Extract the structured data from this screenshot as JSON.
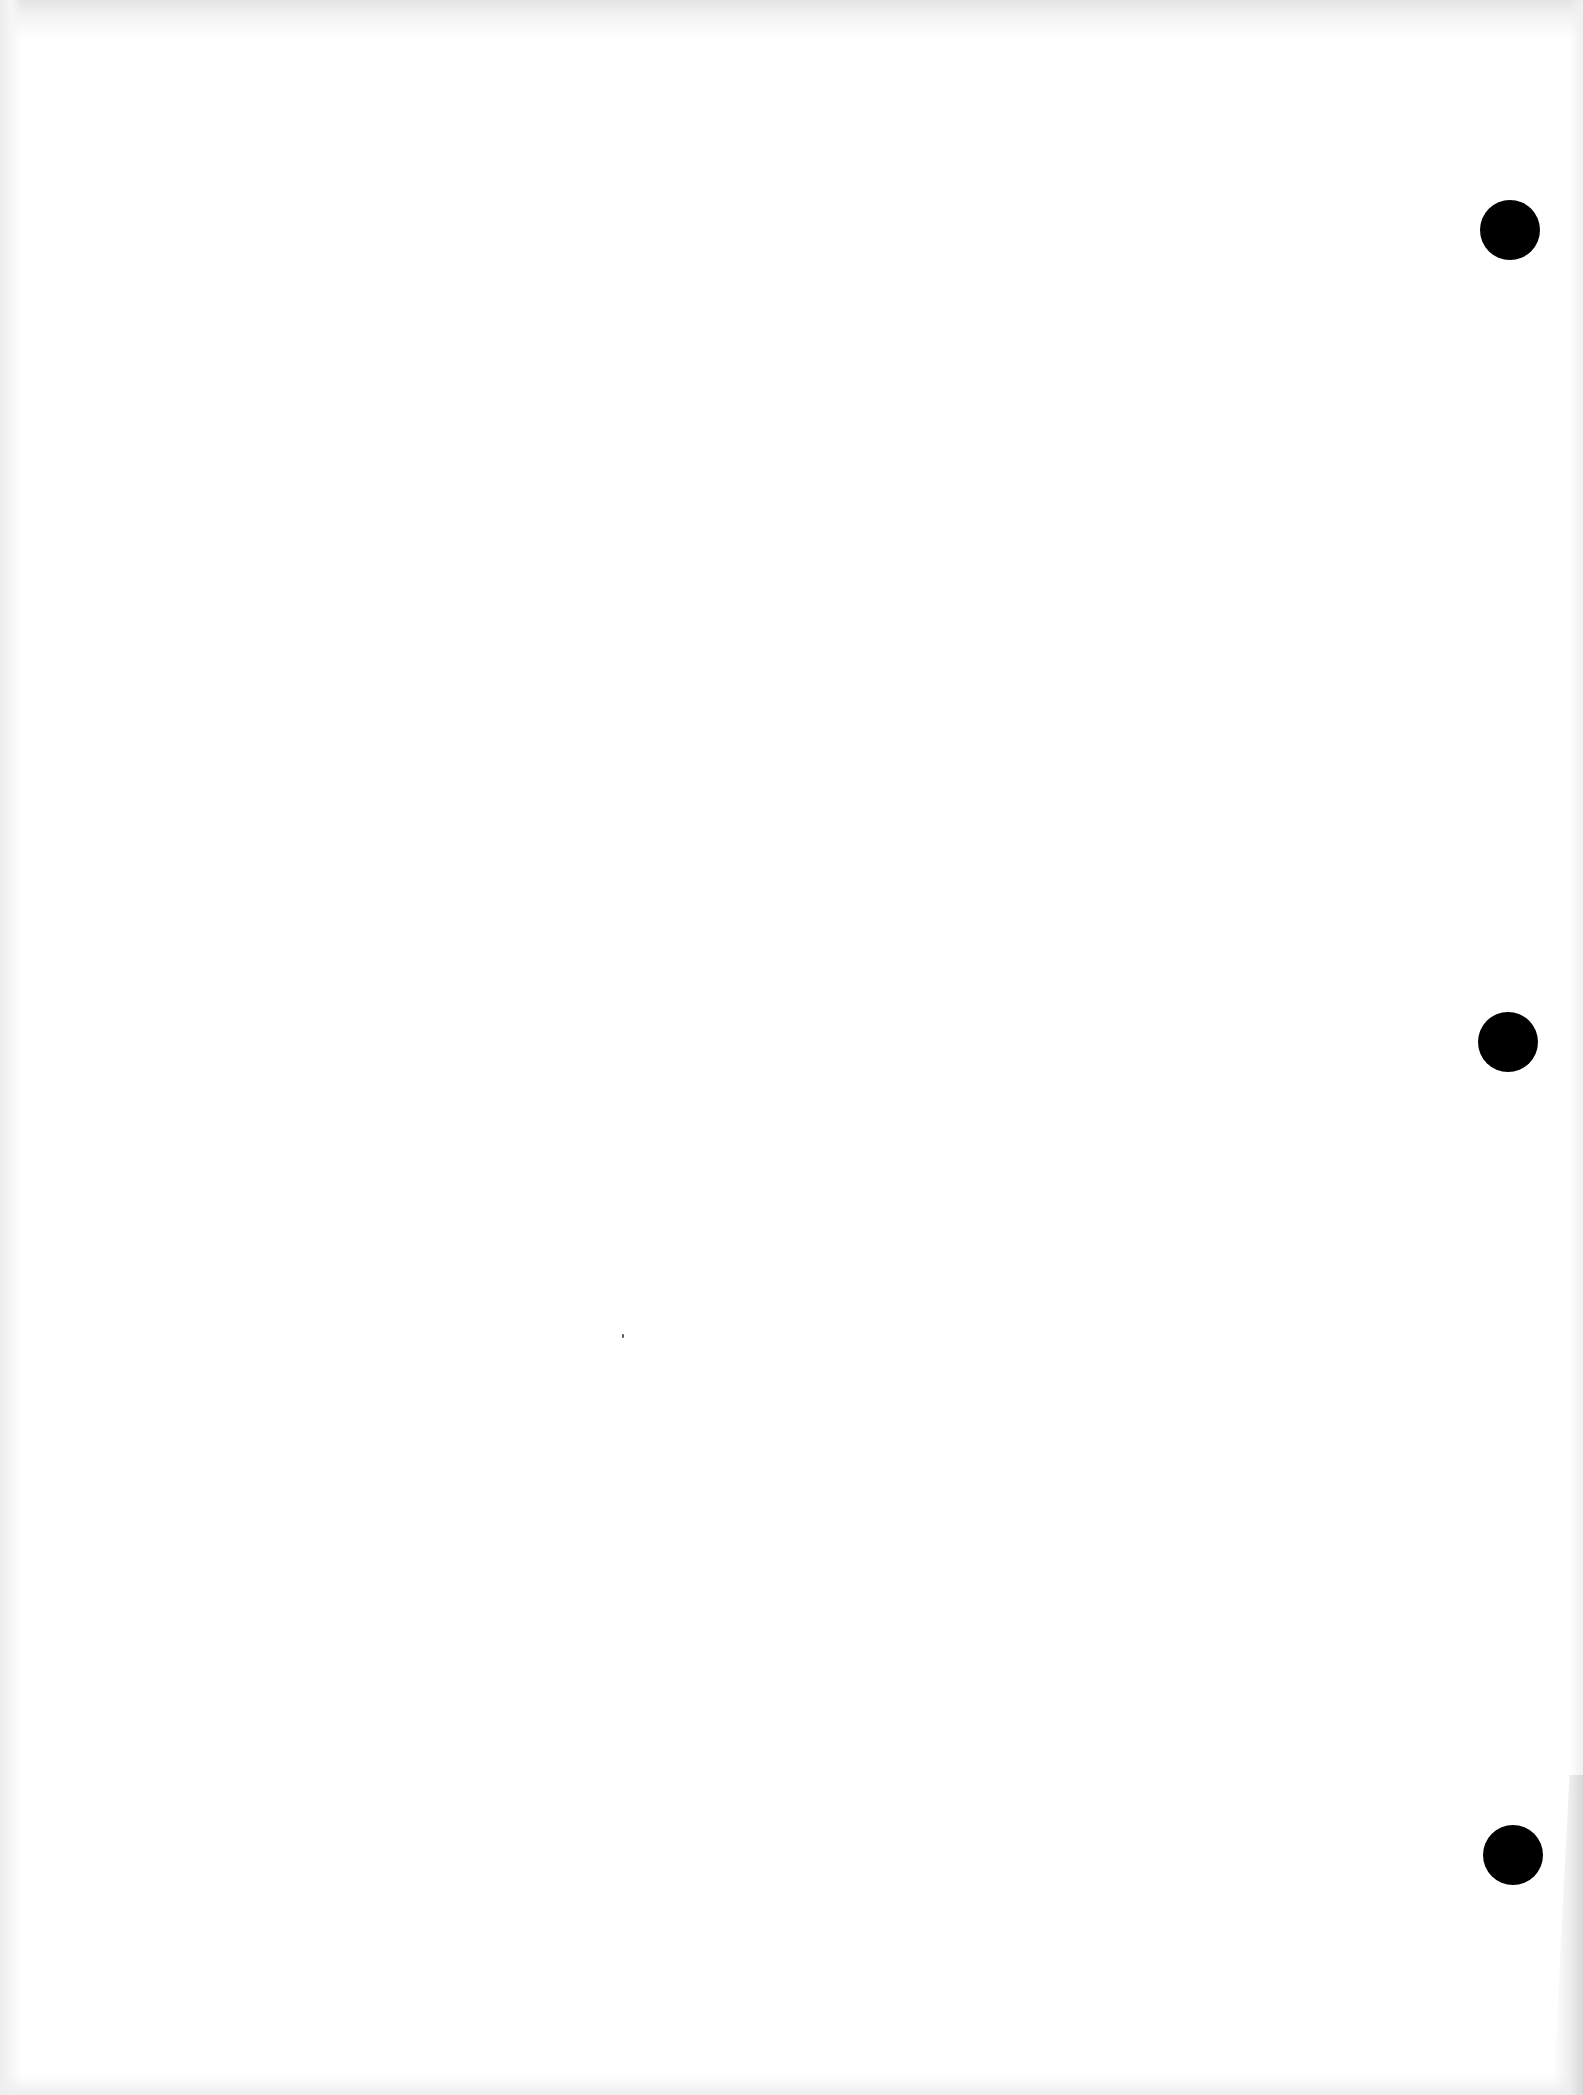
{
  "document": {
    "type": "scanned-blank-page",
    "text_content": "",
    "background_color": "#ffffff",
    "punch_holes": [
      {
        "name": "top",
        "cx": 1510,
        "cy": 230,
        "diameter": 60,
        "color": "#000000"
      },
      {
        "name": "middle",
        "cx": 1508,
        "cy": 1042,
        "diameter": 60,
        "color": "#000000"
      },
      {
        "name": "bottom",
        "cx": 1513,
        "cy": 1855,
        "diameter": 60,
        "color": "#000000"
      }
    ]
  }
}
